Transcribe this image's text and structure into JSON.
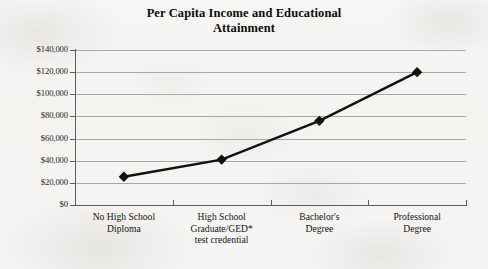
{
  "chart_data": {
    "type": "line",
    "title": "Per Capita Income and Educational Attainment",
    "title_line1": "Per Capita Income and Educational",
    "title_line2": "Attainment",
    "xlabel": "",
    "ylabel": "",
    "categories": [
      "No High School Diploma",
      "High School Graduate/GED* test credential",
      "Bachelor's Degree",
      "Professional Degree"
    ],
    "category_lines": [
      [
        "No High School",
        "Diploma"
      ],
      [
        "High School",
        "Graduate/GED*",
        "test credential"
      ],
      [
        "Bachelor's",
        "Degree"
      ],
      [
        "Professional",
        "Degree"
      ]
    ],
    "values": [
      25500,
      41000,
      76000,
      120000
    ],
    "ylim": [
      0,
      140000
    ],
    "ytick_values": [
      0,
      20000,
      40000,
      60000,
      80000,
      100000,
      120000,
      140000
    ],
    "ytick_labels": [
      "$0",
      "$20,000",
      "$40,000",
      "$60,000",
      "$80,000",
      "$100,000",
      "$120,000",
      "$140,000"
    ],
    "grid": true,
    "legend": false,
    "series_color": "#111111",
    "grid_color": "#a8a8a8",
    "axis_color": "#5c5c5c",
    "marker": "diamond",
    "background_color": "#f6f5f3"
  }
}
